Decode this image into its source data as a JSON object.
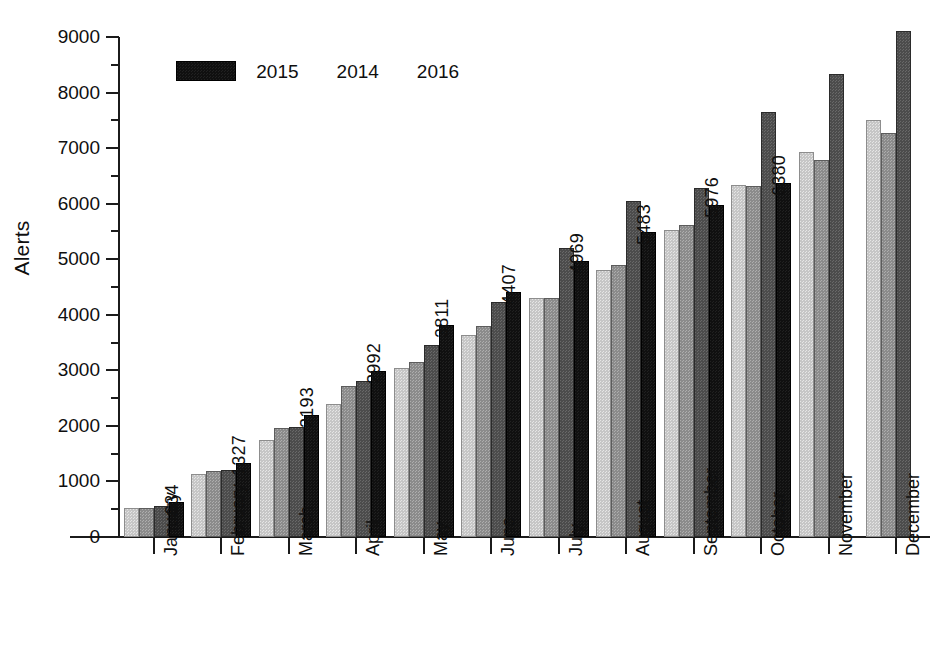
{
  "chart_data": {
    "type": "bar",
    "title": "",
    "subtitle": "",
    "xlabel": "",
    "ylabel": "Alerts",
    "ylim": [
      0,
      9000
    ],
    "ytick_values": [
      0,
      1000,
      2000,
      3000,
      4000,
      5000,
      6000,
      7000,
      8000,
      9000
    ],
    "ytick_labels": [
      "0",
      "1000",
      "2000",
      "3000",
      "4000",
      "5000",
      "6000",
      "7000",
      "8000",
      "9000"
    ],
    "yminor_values": [
      500,
      1500,
      2500,
      3500,
      4500,
      5500,
      6500,
      7500,
      8500
    ],
    "grid": false,
    "legend_position": "upper-left-inside",
    "categories": [
      "January",
      "February",
      "March",
      "April",
      "May",
      "June",
      "July",
      "August",
      "September",
      "October",
      "November",
      "December"
    ],
    "series": [
      {
        "name": "2013",
        "color": "#c6c6c6",
        "values": [
          530,
          1140,
          1755,
          2390,
          3050,
          3640,
          4300,
          4810,
          5520,
          6340,
          6930,
          7510
        ]
      },
      {
        "name": "2014",
        "color": "#8b8b8b",
        "values": [
          525,
          1190,
          1955,
          2725,
          3150,
          3800,
          4300,
          4900,
          5620,
          6310,
          6790,
          7280
        ]
      },
      {
        "name": "2015",
        "color": "#4c4c4c",
        "values": [
          560,
          1215,
          1985,
          2805,
          3465,
          4230,
          5210,
          6050,
          6290,
          7650,
          8330,
          9100
        ]
      },
      {
        "name": "2016",
        "color": "#101010",
        "values": [
          634,
          1327,
          2193,
          2992,
          3811,
          4407,
          4969,
          5483,
          5976,
          6380,
          null,
          null
        ]
      }
    ],
    "value_labels": {
      "series": "2016",
      "values": [
        "634",
        "1327",
        "2193",
        "2992",
        "3811",
        "4407",
        "4969",
        "5483",
        "5976",
        "6380"
      ]
    }
  },
  "legend": {
    "entries": [
      {
        "label": "2013",
        "swatch": "legend-swatch-2013"
      },
      {
        "label": "2015",
        "swatch": "legend-swatch-2015"
      },
      {
        "label": "2014",
        "swatch": "legend-swatch-2014"
      },
      {
        "label": "2016",
        "swatch": "legend-swatch-2016"
      }
    ]
  }
}
